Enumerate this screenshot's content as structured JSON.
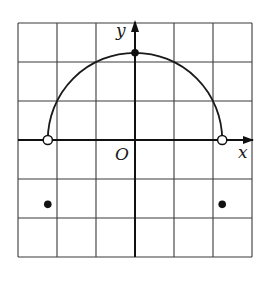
{
  "diagram": {
    "type": "coordinate-grid-graph",
    "grid": {
      "columns": 6,
      "rows": 6,
      "left_px": 18,
      "top_px": 23,
      "cell_px": 39,
      "line_color": "#3a3a3a"
    },
    "axes": {
      "x_label": "x",
      "y_label": "y",
      "origin_label": "O",
      "origin_col": 3,
      "origin_row": 3
    },
    "curve": {
      "kind": "upper-semicircle",
      "center": [
        0,
        0
      ],
      "radius_units": 2.236,
      "stroke": "#1a1a1a"
    },
    "points": [
      {
        "name": "left-endpoint",
        "x": -2.236,
        "y": 0,
        "style": "open"
      },
      {
        "name": "right-endpoint",
        "x": 2.236,
        "y": 0,
        "style": "open"
      },
      {
        "name": "top-point",
        "x": 0,
        "y": 2.236,
        "style": "filled"
      },
      {
        "name": "isolated-left",
        "x": -2.236,
        "y": -1.65,
        "style": "filled"
      },
      {
        "name": "isolated-right",
        "x": 2.236,
        "y": -1.65,
        "style": "filled"
      }
    ]
  }
}
